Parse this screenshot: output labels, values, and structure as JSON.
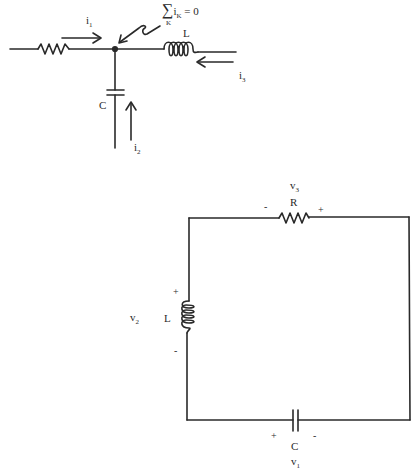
{
  "top_diagram": {
    "name": "kcl-node",
    "equation": {
      "sigma": "∑",
      "var": "i",
      "var_sub": "K",
      "index": "K",
      "rhs": "= 0"
    },
    "currents": [
      {
        "name": "i",
        "sub": "1"
      },
      {
        "name": "i",
        "sub": "2"
      },
      {
        "name": "i",
        "sub": "3"
      }
    ],
    "components": {
      "inductor": "L",
      "capacitor": "C"
    }
  },
  "bottom_diagram": {
    "name": "series-rlc-loop",
    "resistor": {
      "label": "R",
      "voltage": "v",
      "voltage_sub": "3",
      "minus": "-",
      "plus": "+"
    },
    "inductor": {
      "label": "L",
      "voltage": "v",
      "voltage_sub": "2",
      "plus": "+",
      "minus": "-"
    },
    "capacitor": {
      "label": "C",
      "voltage": "v",
      "voltage_sub": "1",
      "plus": "+",
      "minus": "-"
    }
  },
  "colors": {
    "line": "#2a2a2a",
    "background": "#ffffff"
  }
}
